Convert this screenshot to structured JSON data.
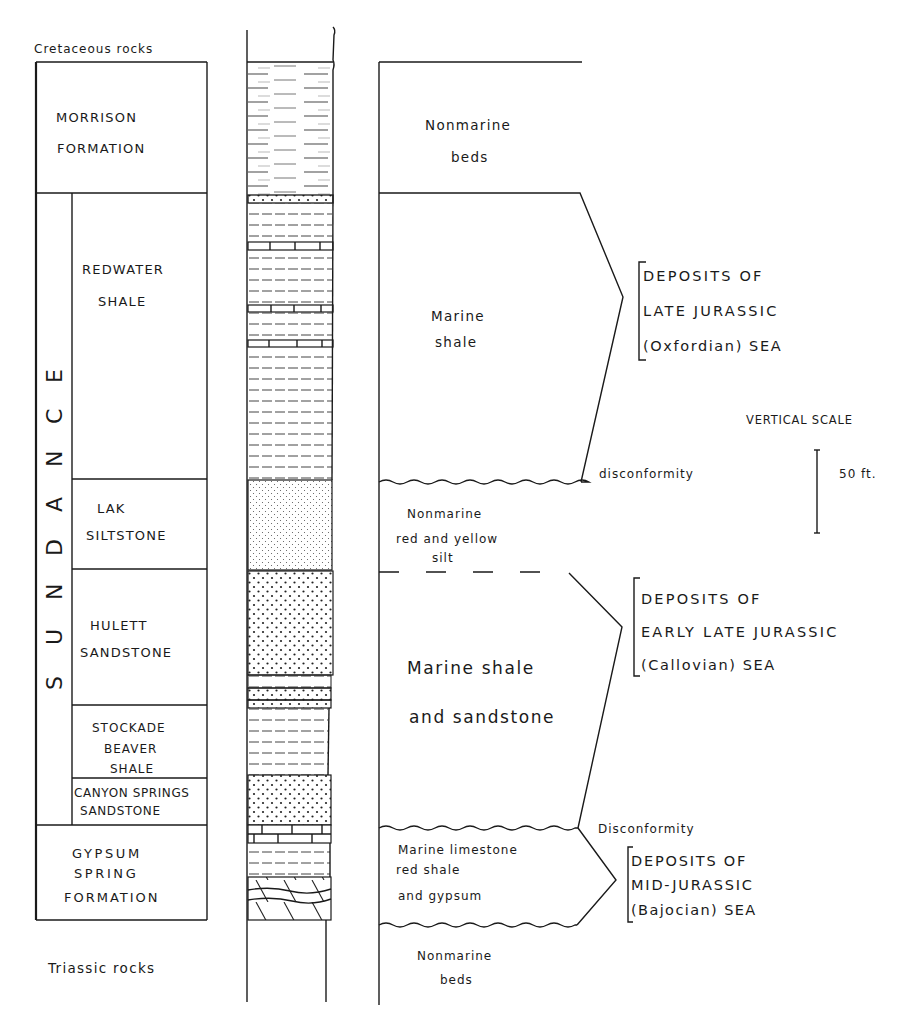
{
  "diagram": {
    "colors": {
      "ink": "#1a1a1a",
      "paper": "#ffffff"
    },
    "top_label": "Cretaceous rocks",
    "bottom_label": "Triassic rocks",
    "group_label": "SUNDANCE",
    "group_letters": [
      "S",
      "U",
      "N",
      "D",
      "A",
      "N",
      "C",
      "E"
    ],
    "formations": [
      {
        "id": "morrison",
        "lines": [
          "MORRISON",
          "FORMATION"
        ]
      },
      {
        "id": "redwater",
        "lines": [
          "REDWATER",
          "SHALE"
        ]
      },
      {
        "id": "lak",
        "lines": [
          "LAK",
          "SILTSTONE"
        ]
      },
      {
        "id": "hulett",
        "lines": [
          "HULETT",
          "SANDSTONE"
        ]
      },
      {
        "id": "stockade",
        "lines": [
          "STOCKADE",
          "BEAVER",
          "SHALE"
        ]
      },
      {
        "id": "canyon",
        "lines": [
          "CANYON SPRINGS",
          "SANDSTONE"
        ]
      },
      {
        "id": "gypsum",
        "lines": [
          "GYPSUM",
          "SPRING",
          "FORMATION"
        ]
      }
    ],
    "environments": [
      {
        "id": "env-morrison",
        "lines": [
          "Nonmarine",
          "beds"
        ]
      },
      {
        "id": "env-redwater",
        "lines": [
          "Marine",
          "shale"
        ]
      },
      {
        "id": "env-lak",
        "lines": [
          "Nonmarine",
          "red and yellow",
          "silt"
        ]
      },
      {
        "id": "env-hulett",
        "lines": [
          "Marine shale",
          "and sandstone"
        ]
      },
      {
        "id": "env-gypsum",
        "lines": [
          "Marine limestone",
          "red shale",
          "and gypsum"
        ]
      },
      {
        "id": "env-triassic",
        "lines": [
          "Nonmarine",
          "beds"
        ]
      }
    ],
    "unconformities": [
      {
        "id": "disc-upper",
        "label": "disconformity"
      },
      {
        "id": "disc-lower",
        "label": "Disconformity"
      }
    ],
    "seas": [
      {
        "id": "sea-oxfordian",
        "lines": [
          "DEPOSITS   OF",
          "LATE  JURASSIC",
          "(Oxfordian) SEA"
        ]
      },
      {
        "id": "sea-callovian",
        "lines": [
          "DEPOSITS   OF",
          "EARLY LATE  JURASSIC",
          "(Callovian)  SEA"
        ]
      },
      {
        "id": "sea-bajocian",
        "lines": [
          "DEPOSITS  OF",
          "MID-JURASSIC",
          "(Bajocian)  SEA"
        ]
      }
    ],
    "scale": {
      "title": "VERTICAL SCALE",
      "value": "50 ft."
    },
    "lithology_column": [
      {
        "pattern": "nonmarine-mudstone",
        "top": 62,
        "bottom": 195
      },
      {
        "pattern": "conglomerate-thin",
        "top": 195,
        "bottom": 203
      },
      {
        "pattern": "shale",
        "top": 203,
        "bottom": 242
      },
      {
        "pattern": "limestone",
        "top": 242,
        "bottom": 250
      },
      {
        "pattern": "shale",
        "top": 250,
        "bottom": 305
      },
      {
        "pattern": "limestone",
        "top": 305,
        "bottom": 312
      },
      {
        "pattern": "shale",
        "top": 312,
        "bottom": 340
      },
      {
        "pattern": "limestone",
        "top": 340,
        "bottom": 347
      },
      {
        "pattern": "shale",
        "top": 347,
        "bottom": 480
      },
      {
        "pattern": "siltstone",
        "top": 480,
        "bottom": 570
      },
      {
        "pattern": "sandstone",
        "top": 570,
        "bottom": 675
      },
      {
        "pattern": "shale",
        "top": 675,
        "bottom": 688
      },
      {
        "pattern": "sandstone",
        "top": 688,
        "bottom": 700
      },
      {
        "pattern": "sandstone",
        "top": 700,
        "bottom": 708
      },
      {
        "pattern": "shale",
        "top": 708,
        "bottom": 775
      },
      {
        "pattern": "sandstone",
        "top": 775,
        "bottom": 825
      },
      {
        "pattern": "limestone",
        "top": 825,
        "bottom": 843
      },
      {
        "pattern": "shale",
        "top": 843,
        "bottom": 877
      },
      {
        "pattern": "gypsum",
        "top": 877,
        "bottom": 920
      }
    ]
  }
}
